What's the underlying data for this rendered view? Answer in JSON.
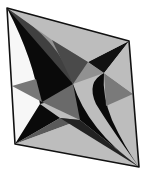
{
  "figure": {
    "colors": {
      "background": "#ffffff",
      "outline": "#111111",
      "light_face": "#bdbdbd",
      "mid_face": "#7a7a7a",
      "dark_face": "#0a0a0a",
      "white_face": "#f7f7f7"
    },
    "vertices": {
      "top_left": [
        7,
        8
      ],
      "top_right": [
        129,
        41
      ],
      "bottom_right": [
        139,
        167
      ],
      "bottom_left": [
        15,
        144
      ],
      "band_left": [
        12,
        86
      ],
      "band_right": [
        133,
        94
      ],
      "center": [
        72,
        96
      ]
    }
  }
}
